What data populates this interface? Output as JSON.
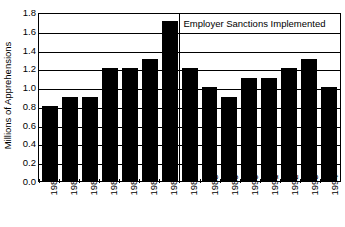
{
  "chart_data": {
    "type": "bar",
    "title": "",
    "xlabel": "",
    "ylabel": "Millions of Apprehensions",
    "categories": [
      "1980",
      "1981",
      "1982",
      "1983",
      "1984",
      "1985",
      "1986",
      "1987",
      "1988",
      "1989",
      "1990",
      "1991",
      "1992",
      "1993",
      "1994"
    ],
    "values": [
      0.8,
      0.9,
      0.9,
      1.2,
      1.2,
      1.3,
      1.7,
      1.2,
      1.0,
      0.9,
      1.1,
      1.1,
      1.2,
      1.3,
      1.0
    ],
    "ylim": [
      0.0,
      1.8
    ],
    "ytick_labels": [
      "0.0",
      "0.2",
      "0.4",
      "0.6",
      "0.8",
      "1.0",
      "1.2",
      "1.4",
      "1.6",
      "1.8"
    ],
    "ytick_values": [
      0.0,
      0.2,
      0.4,
      0.6,
      0.8,
      1.0,
      1.2,
      1.4,
      1.6,
      1.8
    ],
    "grid": true,
    "legend": "none",
    "bar_color": "#000000",
    "annotations": [
      {
        "text": "Employer Sanctions Implemented",
        "type": "vertical-line-with-label",
        "at_category_boundary": "1986|1987",
        "boundary_index": 7
      }
    ]
  }
}
